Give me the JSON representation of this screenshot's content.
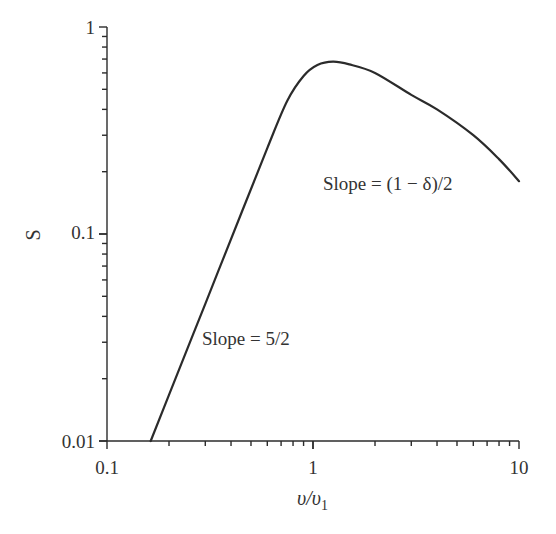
{
  "chart_data": {
    "type": "line",
    "title": "",
    "xlabel": "υ/υ1",
    "xlabel_main": "υ/υ",
    "xlabel_sub": "1",
    "ylabel": "S",
    "xscale": "log",
    "yscale": "log",
    "xlim": [
      0.1,
      10
    ],
    "ylim": [
      0.01,
      1
    ],
    "grid": false,
    "legend": null,
    "x_tick_labels": [
      "0.1",
      "1",
      "10"
    ],
    "y_tick_labels": [
      "0.01",
      "0.1",
      "1"
    ],
    "series": [
      {
        "name": "S",
        "color": "#2b2b2b",
        "x": [
          0.163,
          0.2,
          0.3,
          0.45,
          0.6,
          0.75,
          0.9,
          1.05,
          1.25,
          1.5,
          2.0,
          3.0,
          4.0,
          6.0,
          8.0,
          10.0
        ],
        "y": [
          0.01,
          0.0167,
          0.046,
          0.127,
          0.26,
          0.44,
          0.58,
          0.655,
          0.68,
          0.66,
          0.6,
          0.47,
          0.4,
          0.3,
          0.23,
          0.18
        ]
      }
    ],
    "annotations": [
      {
        "text": "Slope = 5/2",
        "x": 0.3,
        "y": 0.028
      },
      {
        "text": "Slope = (1 − δ)/2",
        "x": 1.3,
        "y": 0.2
      }
    ]
  }
}
